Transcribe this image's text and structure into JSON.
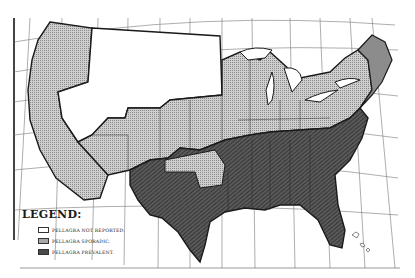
{
  "map": {
    "subject": "Pellagra distribution in the United States",
    "colors": {
      "background": "#ffffff",
      "not_reported": "#ffffff",
      "sporadic": "#bdbdbd",
      "prevalent": "#4a4a4a",
      "outline": "#1a1a1a",
      "graticule": "#555555"
    }
  },
  "legend": {
    "title": "LEGEND:",
    "items": [
      {
        "label": "PELLAGRA NOT REPORTED.",
        "fill": "#ffffff"
      },
      {
        "label": "PELLAGRA SPORADIC.",
        "fill": "#bdbdbd"
      },
      {
        "label": "PELLAGRA PREVALENT.",
        "fill": "#4a4a4a"
      }
    ]
  }
}
